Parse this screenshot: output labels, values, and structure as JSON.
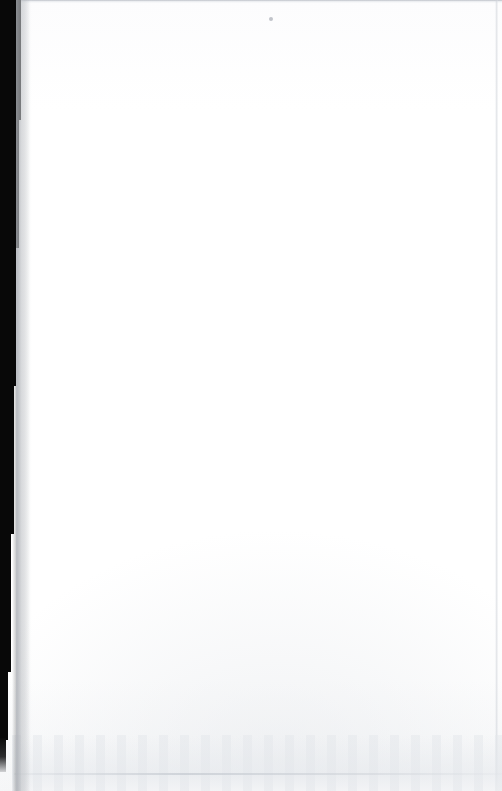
{
  "document": {
    "kind": "scanned-page-image",
    "page_label": "",
    "visible_text": "",
    "body_text": "",
    "notes_text": "",
    "width_px": 502,
    "height_px": 791
  },
  "appearance": {
    "paper_color": "#ffffff",
    "paper_tint": "#fcfcfd",
    "gutter_color": "#080808",
    "edge_shadow_color": "#b6bac1",
    "noise_color": "#e4e7eb",
    "speck_color": "#acb0b8",
    "top_rule_color": "#afb4bc",
    "right_seam_color": "#d0d4da"
  },
  "regions": {
    "gutter_label": "",
    "top_edge_label": "",
    "right_edge_label": "",
    "bottom_wash_label": "",
    "speck_label": ""
  }
}
